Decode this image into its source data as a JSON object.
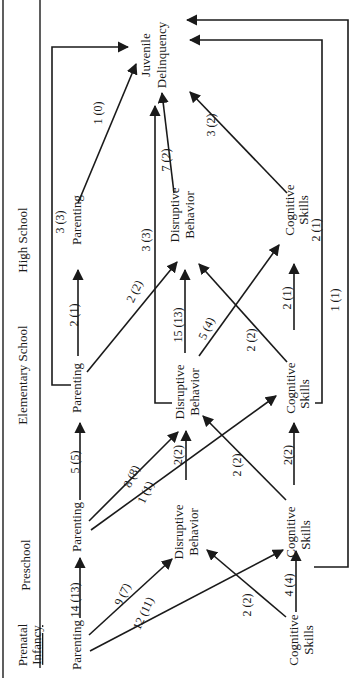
{
  "diagram": {
    "type": "path-diagram",
    "orientation": "rotated-90-ccw",
    "outcome": {
      "line1": "Juvenile",
      "line2": "Delinquency"
    },
    "stages": [
      {
        "id": "prenatal_infancy",
        "line1": "Prenatal",
        "line2": "Infancy"
      },
      {
        "id": "preschool",
        "label": "Preschool"
      },
      {
        "id": "elementary",
        "label": "Elementary School"
      },
      {
        "id": "high_school",
        "label": "High School"
      }
    ],
    "nodes": {
      "pi_parenting": {
        "label": "Parenting"
      },
      "pi_cognitive": {
        "line1": "Cognitive",
        "line2": "Skills"
      },
      "ps_parenting": {
        "label": "Parenting"
      },
      "ps_disruptive": {
        "line1": "Disruptive",
        "line2": "Behavior"
      },
      "ps_cognitive": {
        "line1": "Cognitive",
        "line2": "Skills"
      },
      "es_parenting": {
        "label": "Parenting"
      },
      "es_disruptive": {
        "line1": "Disruptive",
        "line2": "Behavior"
      },
      "es_cognitive": {
        "line1": "Cognitive",
        "line2": "Skills"
      },
      "hs_parenting": {
        "label": "Parenting"
      },
      "hs_disruptive": {
        "line1": "Disruptive",
        "line2": "Behavior"
      },
      "hs_cognitive": {
        "line1": "Cognitive",
        "line2": "Skills"
      }
    },
    "edges": [
      {
        "from": "pi_parenting",
        "to": "ps_parenting",
        "label": "14 (13)"
      },
      {
        "from": "pi_parenting",
        "to": "ps_disruptive",
        "label": "9 (7)"
      },
      {
        "from": "pi_parenting",
        "to": "ps_cognitive",
        "label": "12 (11)"
      },
      {
        "from": "pi_cognitive",
        "to": "ps_disruptive",
        "label": "2 (2)"
      },
      {
        "from": "pi_cognitive",
        "to": "ps_cognitive",
        "label": "4 (4)"
      },
      {
        "from": "ps_parenting",
        "to": "es_parenting",
        "label": "5 (5)"
      },
      {
        "from": "ps_parenting",
        "to": "es_disruptive",
        "label": "8 (8)"
      },
      {
        "from": "ps_parenting",
        "to": "es_cognitive",
        "label": "1 (1)"
      },
      {
        "from": "ps_disruptive",
        "to": "es_disruptive",
        "label": "2(2)"
      },
      {
        "from": "ps_cognitive",
        "to": "es_disruptive",
        "label": "2 (2)"
      },
      {
        "from": "ps_cognitive",
        "to": "es_cognitive",
        "label": "2(2)"
      },
      {
        "from": "ps_cognitive",
        "to": "juvenile_delinquency",
        "label": "1 (1)"
      },
      {
        "from": "es_parenting",
        "to": "hs_parenting",
        "label": "2 (1)"
      },
      {
        "from": "es_parenting",
        "to": "hs_disruptive",
        "label": "2 (2)"
      },
      {
        "from": "es_parenting",
        "to": "juvenile_delinquency",
        "label": ""
      },
      {
        "from": "es_disruptive",
        "to": "hs_disruptive",
        "label": "15 (13)"
      },
      {
        "from": "es_disruptive",
        "to": "hs_cognitive",
        "label": "5 (4)"
      },
      {
        "from": "es_disruptive",
        "to": "juvenile_delinquency",
        "label": "3 (3)"
      },
      {
        "from": "es_cognitive",
        "to": "hs_disruptive",
        "label": "2 (2)"
      },
      {
        "from": "es_cognitive",
        "to": "hs_cognitive",
        "label": "2 (1)"
      },
      {
        "from": "es_cognitive",
        "to": "juvenile_delinquency",
        "label": "2 (1)"
      },
      {
        "from": "hs_parenting",
        "to": "juvenile_delinquency",
        "label": "1 (0)"
      },
      {
        "from": "hs_disruptive",
        "to": "juvenile_delinquency",
        "label": "7 (2)"
      },
      {
        "from": "hs_cognitive",
        "to": "juvenile_delinquency",
        "label": "3 (2)"
      }
    ],
    "extra_labels": {
      "hs_parenting_top": "3 (3)"
    }
  }
}
